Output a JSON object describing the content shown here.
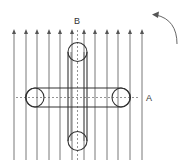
{
  "diagram": {
    "labels": {
      "axis_a": "A",
      "axis_b": "B"
    },
    "field": {
      "direction": "up",
      "arrow_count": 12,
      "arrow_x": [
        14,
        26,
        37,
        49,
        60,
        72,
        84,
        95,
        107,
        118,
        130,
        142
      ],
      "top_y": 30,
      "bottom_y": 160
    },
    "cylinders": [
      {
        "name": "horizontal",
        "axis": "A",
        "x1": 35,
        "x2": 121,
        "cy": 97.5,
        "r": 9.5
      },
      {
        "name": "vertical",
        "axis": "B",
        "cx": 77.5,
        "y1": 52,
        "y2": 141,
        "r": 9.5
      }
    ],
    "rotation_arrow": {
      "direction": "counterclockwise"
    },
    "colors": {
      "line": "#333333",
      "field": "#555555",
      "background": "#ffffff"
    }
  }
}
